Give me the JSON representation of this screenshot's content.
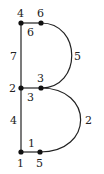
{
  "diagram": {
    "nodes": [
      {
        "id": "n4",
        "label": "4",
        "x": 21,
        "y": 23
      },
      {
        "id": "n6",
        "label": "6",
        "x": 41,
        "y": 23
      },
      {
        "id": "n2",
        "label": "2",
        "x": 21,
        "y": 88
      },
      {
        "id": "n3",
        "label": "3",
        "x": 41,
        "y": 88
      },
      {
        "id": "n1",
        "label": "1",
        "x": 21,
        "y": 152
      },
      {
        "id": "n5",
        "label": "5",
        "x": 40,
        "y": 152
      }
    ],
    "edges": [
      {
        "from": "n4",
        "to": "n6",
        "weight": "6"
      },
      {
        "from": "n4",
        "to": "n2",
        "weight": "7"
      },
      {
        "from": "n6",
        "to": "n3",
        "weight": "5",
        "shape": "arc"
      },
      {
        "from": "n2",
        "to": "n3",
        "weight": "3"
      },
      {
        "from": "n2",
        "to": "n1",
        "weight": "4"
      },
      {
        "from": "n3",
        "to": "n5",
        "weight": "2",
        "shape": "arc"
      },
      {
        "from": "n1",
        "to": "n5",
        "weight": "1"
      }
    ],
    "colors": {
      "stroke": "#222222",
      "node": "#111111"
    }
  }
}
